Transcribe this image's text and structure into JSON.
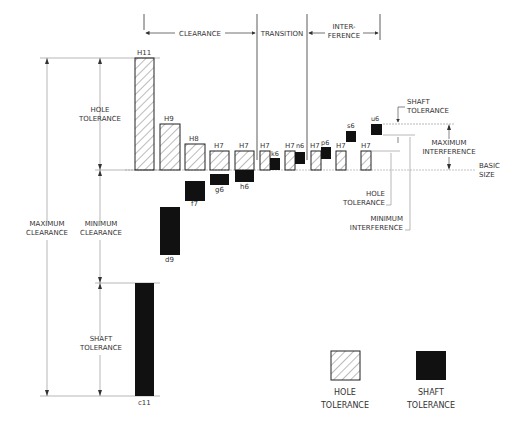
{
  "header": {
    "clearance": "CLEARANCE",
    "transition": "TRANSITION",
    "interference_1": "INTER-",
    "interference_2": "FERENCE"
  },
  "left_labels": {
    "hole_tolerance_1": "HOLE",
    "hole_tolerance_2": "TOLERANCE",
    "maximum_clearance_1": "MAXIMUM",
    "maximum_clearance_2": "CLEARANCE",
    "minimum_clearance_1": "MINIMUM",
    "minimum_clearance_2": "CLEARANCE",
    "shaft_tolerance_1": "SHAFT",
    "shaft_tolerance_2": "TOLERANCE"
  },
  "right_labels": {
    "shaft_tolerance_1": "SHAFT",
    "shaft_tolerance_2": "TOLERANCE",
    "maximum_interference_1": "MAXIMUM",
    "maximum_interference_2": "INTERFERENCE",
    "basic_size_1": "BASIC",
    "basic_size_2": "SIZE",
    "hole_tolerance_1": "HOLE",
    "hole_tolerance_2": "TOLERANCE",
    "minimum_interference_1": "MINIMUM",
    "minimum_interference_2": "INTERFERENCE"
  },
  "holes": [
    "H11",
    "H9",
    "H8",
    "H7",
    "H7",
    "H7",
    "H7",
    "H7",
    "H7",
    "H7"
  ],
  "shafts": [
    "c11",
    "d9",
    "f7",
    "g6",
    "h6",
    "k6",
    "n6",
    "p6",
    "s6",
    "u6"
  ],
  "legend": {
    "hole_1": "HOLE",
    "hole_2": "TOLERANCE",
    "shaft_1": "SHAFT",
    "shaft_2": "TOLERANCE"
  },
  "colors": {
    "line": "#333333",
    "shaft_fill": "#111111",
    "dim_line": "#888888"
  }
}
